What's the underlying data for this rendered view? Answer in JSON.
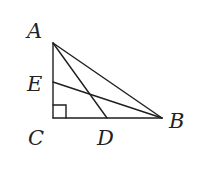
{
  "figure": {
    "type": "right triangle with cevians",
    "right_angle_at": "C",
    "points": {
      "A": {
        "label": "A",
        "x": 53,
        "y": 43,
        "lx": 27,
        "ly": 38
      },
      "B": {
        "label": "B",
        "x": 162,
        "y": 118,
        "lx": 169,
        "ly": 128
      },
      "C": {
        "label": "C",
        "x": 53,
        "y": 118,
        "lx": 28,
        "ly": 145
      },
      "D": {
        "label": "D",
        "x": 107,
        "y": 118,
        "lx": 97,
        "ly": 145
      },
      "E": {
        "label": "E",
        "x": 53,
        "y": 82,
        "lx": 27,
        "ly": 91
      }
    },
    "segments": [
      [
        "A",
        "C"
      ],
      [
        "C",
        "B"
      ],
      [
        "A",
        "B"
      ],
      [
        "A",
        "D"
      ],
      [
        "E",
        "B"
      ]
    ],
    "right_angle_marker_size": 13,
    "colors": {
      "stroke": "#1e1e1e",
      "text": "#222222",
      "background": "#ffffff"
    }
  }
}
